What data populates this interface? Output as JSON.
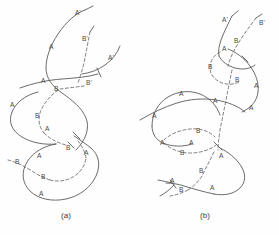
{
  "figure": {
    "title": "",
    "background_color": "#fefefe",
    "stroke_color": "#5e5a58",
    "dashed_stroke_color": "#6b6764",
    "label_color": "#4a4745"
  },
  "panels": [
    {
      "id": "panel-a",
      "caption": "(a)",
      "caption_x": 66,
      "caption_y": 218,
      "labels": [
        {
          "id": "a-lbl-1",
          "text": "A'",
          "x": 75,
          "y": 15
        },
        {
          "id": "a-lbl-2",
          "text": "B'",
          "x": 82,
          "y": 41
        },
        {
          "id": "a-lbl-3",
          "text": "A",
          "x": 49,
          "y": 49
        },
        {
          "id": "a-lbl-4",
          "text": "A'",
          "x": 108,
          "y": 60
        },
        {
          "id": "a-lbl-5",
          "text": "A",
          "x": 41,
          "y": 83
        },
        {
          "id": "a-lbl-6",
          "text": "B",
          "x": 54,
          "y": 91
        },
        {
          "id": "a-lbl-7",
          "text": "B'",
          "x": 86,
          "y": 85
        },
        {
          "id": "a-lbl-8",
          "text": "A",
          "x": 10,
          "y": 107
        },
        {
          "id": "a-lbl-9",
          "text": "B",
          "x": 35,
          "y": 118
        },
        {
          "id": "a-lbl-10",
          "text": "A",
          "x": 45,
          "y": 131
        },
        {
          "id": "a-lbl-11",
          "text": "B",
          "x": 66,
          "y": 150
        },
        {
          "id": "a-lbl-12",
          "text": "A",
          "x": 37,
          "y": 158
        },
        {
          "id": "a-lbl-13",
          "text": "A",
          "x": 84,
          "y": 155
        },
        {
          "id": "a-lbl-14",
          "text": "B",
          "x": 15,
          "y": 164
        },
        {
          "id": "a-lbl-15",
          "text": "B",
          "x": 41,
          "y": 179
        },
        {
          "id": "a-lbl-16",
          "text": "A",
          "x": 39,
          "y": 196
        }
      ]
    },
    {
      "id": "panel-b",
      "caption": "(b)",
      "caption_x": 205,
      "caption_y": 218,
      "labels": [
        {
          "id": "b-lbl-1",
          "text": "A'",
          "x": 222,
          "y": 22
        },
        {
          "id": "b-lbl-2",
          "text": "B'",
          "x": 259,
          "y": 25
        },
        {
          "id": "b-lbl-3",
          "text": "B",
          "x": 234,
          "y": 43
        },
        {
          "id": "b-lbl-4",
          "text": "A",
          "x": 222,
          "y": 51
        },
        {
          "id": "b-lbl-5",
          "text": "B",
          "x": 208,
          "y": 69
        },
        {
          "id": "b-lbl-6",
          "text": "A",
          "x": 254,
          "y": 88
        },
        {
          "id": "b-lbl-7",
          "text": "B",
          "x": 235,
          "y": 82
        },
        {
          "id": "b-lbl-8",
          "text": "A",
          "x": 179,
          "y": 96
        },
        {
          "id": "b-lbl-9",
          "text": "A",
          "x": 213,
          "y": 103
        },
        {
          "id": "b-lbl-10",
          "text": "A",
          "x": 249,
          "y": 110
        },
        {
          "id": "b-lbl-11",
          "text": "A",
          "x": 152,
          "y": 118
        },
        {
          "id": "b-lbl-12",
          "text": "B",
          "x": 196,
          "y": 133
        },
        {
          "id": "b-lbl-13",
          "text": "A",
          "x": 160,
          "y": 145
        },
        {
          "id": "b-lbl-14",
          "text": "A",
          "x": 189,
          "y": 145
        },
        {
          "id": "b-lbl-15",
          "text": "B",
          "x": 180,
          "y": 155
        },
        {
          "id": "b-lbl-16",
          "text": "A",
          "x": 219,
          "y": 158
        },
        {
          "id": "b-lbl-17",
          "text": "B",
          "x": 199,
          "y": 173
        },
        {
          "id": "b-lbl-18",
          "text": "B",
          "x": 179,
          "y": 192
        },
        {
          "id": "b-lbl-19",
          "text": "A",
          "x": 170,
          "y": 183
        },
        {
          "id": "b-lbl-20",
          "text": "A",
          "x": 210,
          "y": 190
        }
      ]
    }
  ]
}
